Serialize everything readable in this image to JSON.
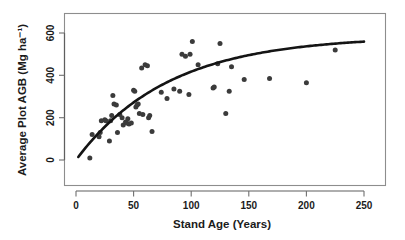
{
  "chart_data": {
    "type": "scatter",
    "title": "",
    "xlabel": "Stand Age (Years)",
    "ylabel": "Average Plot AGB (Mg ha⁻¹)",
    "xlim": [
      -8,
      262
    ],
    "ylim": [
      -55,
      700
    ],
    "xticks": [
      0,
      50,
      100,
      150,
      200,
      250
    ],
    "xtick_labels": [
      "0",
      "50",
      "100",
      "150",
      "200",
      "250"
    ],
    "yticks": [
      0,
      200,
      400,
      600
    ],
    "ytick_labels": [
      "0",
      "200",
      "400",
      "600"
    ],
    "grid": false,
    "legend": null,
    "point_color": "#3b3b3b",
    "curve_color": "#141414",
    "frame_color": "#8d8d8d",
    "series": [
      {
        "name": "Plot observations",
        "marker": "filled-circle",
        "points": [
          [
            12,
            10
          ],
          [
            14,
            120
          ],
          [
            20,
            110
          ],
          [
            21,
            130
          ],
          [
            22,
            185
          ],
          [
            25,
            190
          ],
          [
            26,
            185
          ],
          [
            29,
            90
          ],
          [
            30,
            185
          ],
          [
            31,
            210
          ],
          [
            32,
            305
          ],
          [
            33,
            265
          ],
          [
            35,
            260
          ],
          [
            36,
            130
          ],
          [
            38,
            215
          ],
          [
            40,
            200
          ],
          [
            41,
            165
          ],
          [
            43,
            180
          ],
          [
            44,
            175
          ],
          [
            45,
            195
          ],
          [
            46,
            170
          ],
          [
            48,
            175
          ],
          [
            50,
            330
          ],
          [
            51,
            325
          ],
          [
            52,
            250
          ],
          [
            53,
            260
          ],
          [
            54,
            265
          ],
          [
            55,
            220
          ],
          [
            57,
            435
          ],
          [
            58,
            215
          ],
          [
            60,
            450
          ],
          [
            62,
            445
          ],
          [
            63,
            200
          ],
          [
            64,
            210
          ],
          [
            66,
            135
          ],
          [
            74,
            320
          ],
          [
            79,
            290
          ],
          [
            85,
            335
          ],
          [
            90,
            325
          ],
          [
            92,
            500
          ],
          [
            95,
            490
          ],
          [
            98,
            310
          ],
          [
            99,
            500
          ],
          [
            101,
            560
          ],
          [
            106,
            450
          ],
          [
            119,
            340
          ],
          [
            120,
            345
          ],
          [
            123,
            455
          ],
          [
            125,
            550
          ],
          [
            130,
            220
          ],
          [
            133,
            325
          ],
          [
            135,
            440
          ],
          [
            146,
            380
          ],
          [
            168,
            385
          ],
          [
            200,
            365
          ],
          [
            225,
            520
          ]
        ]
      }
    ],
    "fit_curve": {
      "name": "Fitted asymptotic growth curve",
      "asymptote": 585,
      "rate": 0.0125,
      "x_start": 2,
      "x_end": 250,
      "y_start": 0,
      "y_end": 530,
      "style": "solid"
    }
  }
}
